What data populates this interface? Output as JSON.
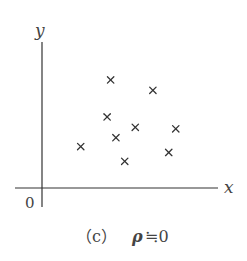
{
  "chart_data": {
    "type": "scatter",
    "title": "",
    "xlabel": "x",
    "ylabel": "y",
    "origin_label": "0",
    "marker": "x",
    "xlim": [
      0,
      10
    ],
    "ylim": [
      0,
      10
    ],
    "grid": false,
    "points": [
      {
        "x": 2.2,
        "y": 2.8
      },
      {
        "x": 3.9,
        "y": 7.3
      },
      {
        "x": 3.7,
        "y": 4.8
      },
      {
        "x": 4.2,
        "y": 3.4
      },
      {
        "x": 4.7,
        "y": 1.8
      },
      {
        "x": 5.3,
        "y": 4.1
      },
      {
        "x": 6.3,
        "y": 6.6
      },
      {
        "x": 7.6,
        "y": 4.0
      },
      {
        "x": 7.2,
        "y": 2.4
      }
    ],
    "caption": {
      "label": "（c）",
      "rho": "ρ",
      "relation": "≒0"
    }
  }
}
